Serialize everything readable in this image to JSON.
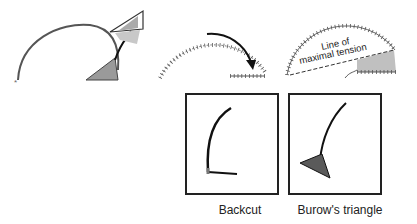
{
  "figure": {
    "panels": [
      {
        "id": "arc-with-triangle",
        "description": "Semicircular arc with a shaded triangle being excised (arrow moves triangle away)"
      },
      {
        "id": "sutured-arc-rotation",
        "description": "Sutured semicircle with curved arrow showing rotation"
      },
      {
        "id": "line-of-maximal-tension",
        "description": "Sutured semicircle with dashed line and shaded area"
      }
    ],
    "annotation": {
      "line1": "Line of",
      "line2": "maximal tension"
    },
    "captions": {
      "backcut": "Backcut",
      "burow": "Burow's triangle"
    },
    "colors": {
      "line": "#333333",
      "shade": "#9a9a9a",
      "shade_light": "#c8c8c8"
    }
  }
}
